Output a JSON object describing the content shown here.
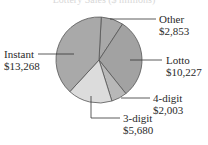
{
  "chart_data": {
    "type": "pie",
    "title": "Lottery Sales ($ millions)",
    "categories": [
      "Other",
      "Lotto",
      "4-digit",
      "3-digit",
      "Instant"
    ],
    "values": [
      2853,
      10227,
      2003,
      5680,
      13268
    ],
    "labels": [
      "$2,853",
      "$10,227",
      "$2,003",
      "$5,680",
      "$13,268"
    ],
    "colors": [
      "#a8a8a8",
      "#a2a2a2",
      "#b8b8b8",
      "#dcdcdc",
      "#a9a9a9"
    ],
    "legend": "none (callout labels)"
  },
  "labels": {
    "other": {
      "name": "Other",
      "value": "$2,853"
    },
    "lotto": {
      "name": "Lotto",
      "value": "$10,227"
    },
    "fourdigit": {
      "name": "4-digit",
      "value": "$2,003"
    },
    "threedigit": {
      "name": "3-digit",
      "value": "$5,680"
    },
    "instant": {
      "name": "Instant",
      "value": "$13,268"
    }
  }
}
